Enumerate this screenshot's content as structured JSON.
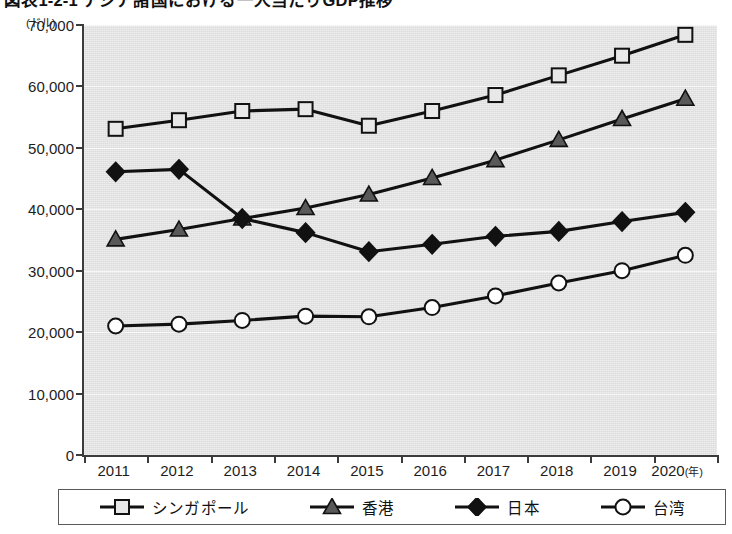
{
  "title": "図表1-2-1 アジア諸国における一人当たりGDP推移",
  "axis": {
    "y_unit": "(ドル)",
    "x_unit": "(年)",
    "y_ticks": [
      "70,000",
      "60,000",
      "50,000",
      "40,000",
      "30,000",
      "20,000",
      "10,000",
      "0"
    ]
  },
  "legend": {
    "items": [
      {
        "label": "シンガポール",
        "marker": "square-marker",
        "color": "#e8e8e8"
      },
      {
        "label": "香港",
        "marker": "triangle-marker",
        "color": "#595959"
      },
      {
        "label": "日本",
        "marker": "diamond-marker",
        "color": "#111111"
      },
      {
        "label": "台湾",
        "marker": "circle-marker",
        "color": "#ffffff"
      }
    ]
  },
  "chart_data": {
    "type": "line",
    "title": "図表1-2-1 アジア諸国における一人当たりGDP推移",
    "xlabel": "(年)",
    "ylabel": "(ドル)",
    "xlim": [
      2011,
      2020
    ],
    "ylim": [
      0,
      70000
    ],
    "ytick_step": 10000,
    "grid": true,
    "legend_position": "bottom",
    "categories": [
      "2011",
      "2012",
      "2013",
      "2014",
      "2015",
      "2016",
      "2017",
      "2018",
      "2019",
      "2020"
    ],
    "x": [
      2011,
      2012,
      2013,
      2014,
      2015,
      2016,
      2017,
      2018,
      2019,
      2020
    ],
    "series": [
      {
        "name": "シンガポール",
        "marker": "square",
        "marker_fill": "#e8e8e8",
        "line_color": "#111111",
        "values": [
          53100,
          54500,
          56000,
          56300,
          53600,
          56000,
          58600,
          61800,
          65000,
          68400
        ]
      },
      {
        "name": "香港",
        "marker": "triangle",
        "marker_fill": "#595959",
        "line_color": "#111111",
        "values": [
          35100,
          36700,
          38500,
          40200,
          42400,
          45100,
          48000,
          51300,
          54700,
          58000
        ]
      },
      {
        "name": "日本",
        "marker": "diamond",
        "marker_fill": "#111111",
        "line_color": "#111111",
        "values": [
          46100,
          46500,
          38500,
          36200,
          33100,
          34300,
          35600,
          36400,
          38000,
          39500
        ]
      },
      {
        "name": "台湾",
        "marker": "circle",
        "marker_fill": "#ffffff",
        "line_color": "#111111",
        "values": [
          21000,
          21300,
          21900,
          22600,
          22500,
          24000,
          25900,
          28000,
          30000,
          32500
        ]
      }
    ]
  }
}
